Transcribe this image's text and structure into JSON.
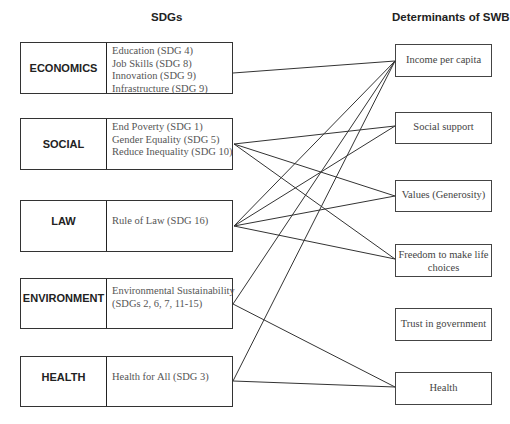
{
  "headers": {
    "left": "SDGs",
    "right": "Determinants of SWB"
  },
  "sdg_groups": [
    {
      "id": "economics",
      "category": "ECONOMICS",
      "goals": [
        "Education (SDG 4)",
        "Job Skills (SDG 8)",
        "Innovation (SDG 9)",
        "Infrastructure (SDG 9)"
      ]
    },
    {
      "id": "social",
      "category": "SOCIAL",
      "goals": [
        "End Poverty (SDG 1)",
        "Gender Equality (SDG 5)",
        "Reduce Inequality (SDG 10)"
      ]
    },
    {
      "id": "law",
      "category": "LAW",
      "goals": [
        "Rule of Law (SDG 16)"
      ]
    },
    {
      "id": "environment",
      "category": "ENVIRONMENT",
      "goals": [
        "Environmental Sustainability",
        "(SDGs 2, 6, 7, 11-15)"
      ]
    },
    {
      "id": "health",
      "category": "HEALTH",
      "goals": [
        "Health for All (SDG 3)"
      ]
    }
  ],
  "determinants": [
    {
      "id": "income",
      "label": "Income per capita"
    },
    {
      "id": "social_support",
      "label": "Social support"
    },
    {
      "id": "values",
      "label": "Values (Generosity)"
    },
    {
      "id": "freedom",
      "label": "Freedom to make life choices"
    },
    {
      "id": "trust",
      "label": "Trust in government"
    },
    {
      "id": "health_det",
      "label": "Health"
    }
  ],
  "connections": [
    {
      "from": "economics",
      "to": "income"
    },
    {
      "from": "social",
      "to": "social_support"
    },
    {
      "from": "social",
      "to": "values"
    },
    {
      "from": "social",
      "to": "freedom"
    },
    {
      "from": "law",
      "to": "income"
    },
    {
      "from": "law",
      "to": "social_support"
    },
    {
      "from": "law",
      "to": "values"
    },
    {
      "from": "law",
      "to": "freedom"
    },
    {
      "from": "environment",
      "to": "income"
    },
    {
      "from": "environment",
      "to": "health_det"
    },
    {
      "from": "health",
      "to": "income"
    },
    {
      "from": "health",
      "to": "health_det"
    }
  ]
}
